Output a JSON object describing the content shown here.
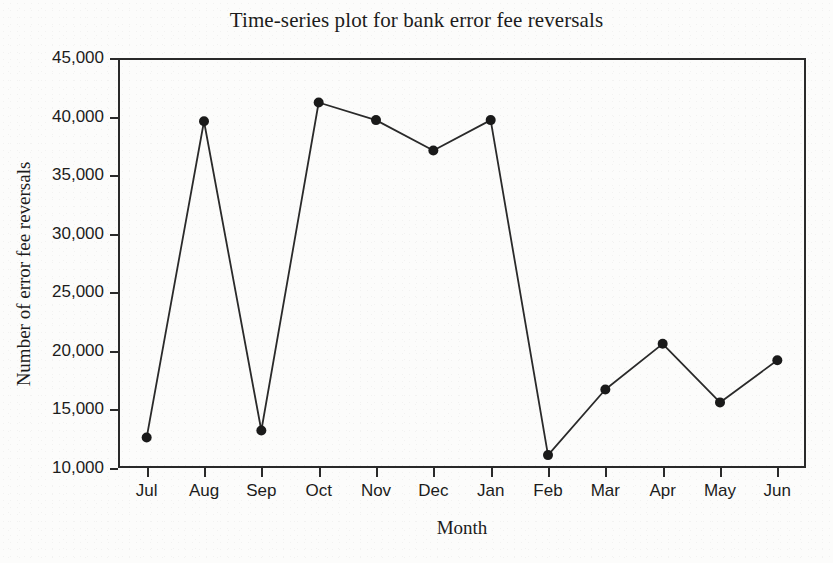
{
  "chart_data": {
    "type": "line",
    "title": "Time-series plot for bank error fee reversals",
    "xlabel": "Month",
    "ylabel": "Number of error fee reversals",
    "categories": [
      "Jul",
      "Aug",
      "Sep",
      "Oct",
      "Nov",
      "Dec",
      "Jan",
      "Feb",
      "Mar",
      "Apr",
      "May",
      "Jun"
    ],
    "values": [
      12600,
      39600,
      13200,
      41200,
      39700,
      37100,
      39700,
      11100,
      16700,
      20600,
      15600,
      19200
    ],
    "ylim": [
      10000,
      45000
    ],
    "ytick_values": [
      10000,
      15000,
      20000,
      25000,
      30000,
      35000,
      40000,
      45000
    ],
    "ytick_labels": [
      "10,000",
      "15,000",
      "20,000",
      "25,000",
      "30,000",
      "35,000",
      "40,000",
      "45,000"
    ],
    "grid": false,
    "legend": false,
    "marker": "filled-circle",
    "line_color": "#2a2a2a",
    "marker_color": "#1a1a1a",
    "background_color": "#fcfcfb"
  }
}
